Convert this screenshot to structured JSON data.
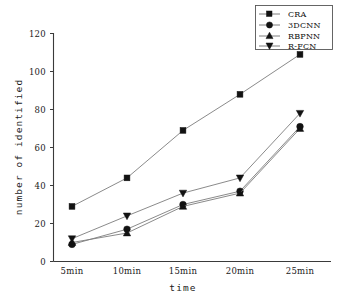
{
  "chart_data": {
    "type": "line",
    "title": "",
    "xlabel": "time",
    "ylabel": "number of identified",
    "categories": [
      "5min",
      "10min",
      "15min",
      "20min",
      "25min"
    ],
    "ylim": [
      0,
      120
    ],
    "yticks": [
      0,
      20,
      40,
      60,
      80,
      100,
      120
    ],
    "grid": false,
    "legend_position": "top-right",
    "series": [
      {
        "name": "CRA",
        "marker": "square",
        "values": [
          29,
          44,
          69,
          88,
          109
        ]
      },
      {
        "name": "3DCNN",
        "marker": "circle",
        "values": [
          9,
          17,
          30,
          37,
          71
        ]
      },
      {
        "name": "RBPNN",
        "marker": "triangle-up",
        "values": [
          10,
          15,
          29,
          36,
          70
        ]
      },
      {
        "name": "R-FCN",
        "marker": "triangle-down",
        "values": [
          12,
          24,
          36,
          44,
          78
        ]
      }
    ]
  },
  "axes": {
    "y_tick_labels": [
      "0",
      "20",
      "40",
      "60",
      "80",
      "100",
      "120"
    ],
    "x_tick_labels": [
      "5min",
      "10min",
      "15min",
      "20min",
      "25min"
    ],
    "y_axis_title": "number of identified",
    "x_axis_title": "time"
  },
  "legend": {
    "entries": [
      {
        "label": "CRA"
      },
      {
        "label": "3DCNN"
      },
      {
        "label": "RBPNN"
      },
      {
        "label": "R-FCN"
      }
    ]
  },
  "colors": {
    "line": "#7d7d7d",
    "marker": "#121212",
    "axis": "#3a3a3a",
    "background": "#ffffff",
    "legend_border": "#555555"
  }
}
